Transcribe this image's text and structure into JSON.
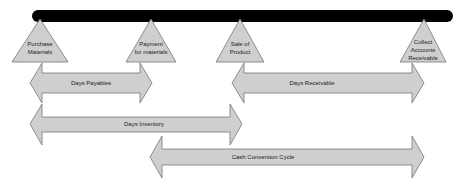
{
  "diagram": {
    "title": "",
    "timeline": {
      "color": "#000000"
    },
    "milestones": [
      {
        "id": "purchase",
        "lines": [
          "Purchase",
          "Materials"
        ]
      },
      {
        "id": "payment",
        "lines": [
          "Payment",
          "for materials"
        ]
      },
      {
        "id": "sale",
        "lines": [
          "Sale of",
          "Product"
        ]
      },
      {
        "id": "collect",
        "lines": [
          "Collect",
          "Accounts",
          "Receivable"
        ]
      }
    ],
    "periods": [
      {
        "id": "days-payables",
        "label": "Days Payables",
        "from": "purchase",
        "to": "payment"
      },
      {
        "id": "days-receivable",
        "label": "Days Receivable",
        "from": "sale",
        "to": "collect"
      },
      {
        "id": "days-inventory",
        "label": "Days Inventory",
        "from": "purchase",
        "to": "sale"
      },
      {
        "id": "cash-conversion-cycle",
        "label": "Cash Conversion Cycle",
        "from": "payment",
        "to": "collect"
      }
    ],
    "colors": {
      "shape_fill": "#cfcfcf",
      "shape_stroke": "#777777",
      "text": "#222222"
    }
  }
}
